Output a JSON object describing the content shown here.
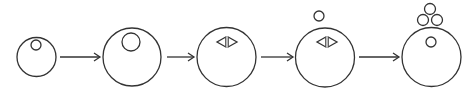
{
  "diagram": {
    "type": "process-sequence",
    "stroke_color": "#333333",
    "background": "#ffffff",
    "stages": [
      {
        "id": "stage-1",
        "cell": {
          "cx": 36.5,
          "cy": 57,
          "r": 19.5
        },
        "inner_circles": [
          {
            "cx": 36,
            "cy": 45,
            "r": 5
          }
        ],
        "spindle": null,
        "outer_circles": []
      },
      {
        "id": "stage-2",
        "cell": {
          "cx": 132,
          "cy": 57,
          "r": 29
        },
        "inner_circles": [
          {
            "cx": 131,
            "cy": 42,
            "r": 9
          }
        ],
        "spindle": null,
        "outer_circles": []
      },
      {
        "id": "stage-3",
        "cell": {
          "cx": 226.5,
          "cy": 57,
          "r": 29.5
        },
        "inner_circles": [],
        "spindle": {
          "cx": 227,
          "cy": 42,
          "half_width": 10,
          "half_height": 5
        },
        "outer_circles": []
      },
      {
        "id": "stage-4",
        "cell": {
          "cx": 325,
          "cy": 57.5,
          "r": 29.5
        },
        "inner_circles": [],
        "spindle": {
          "cx": 327,
          "cy": 42,
          "half_width": 10,
          "half_height": 5
        },
        "outer_circles": [
          {
            "cx": 319,
            "cy": 16,
            "r": 5
          }
        ]
      },
      {
        "id": "stage-5",
        "cell": {
          "cx": 431.5,
          "cy": 57,
          "r": 29.5
        },
        "inner_circles": [
          {
            "cx": 431,
            "cy": 42,
            "r": 5
          }
        ],
        "spindle": null,
        "outer_circles": [
          {
            "cx": 430,
            "cy": 9,
            "r": 5.5
          },
          {
            "cx": 423,
            "cy": 20,
            "r": 5.5
          },
          {
            "cx": 437,
            "cy": 20,
            "r": 5.5
          }
        ]
      }
    ],
    "arrows": [
      {
        "x1": 60,
        "x2": 100,
        "y": 57
      },
      {
        "x1": 167,
        "x2": 194,
        "y": 57
      },
      {
        "x1": 261,
        "x2": 293,
        "y": 57
      },
      {
        "x1": 359,
        "x2": 399,
        "y": 57
      }
    ]
  }
}
